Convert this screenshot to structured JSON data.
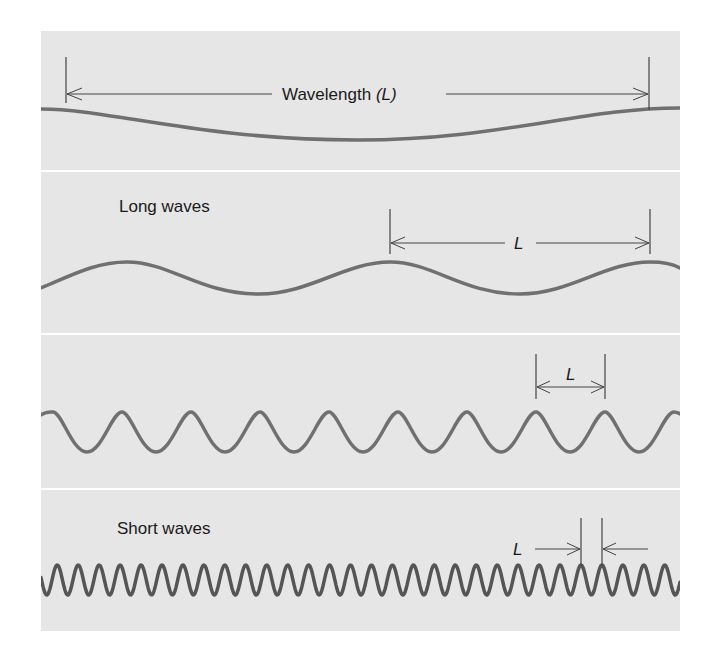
{
  "figure": {
    "background": "#ffffff",
    "panel_color": "#e6e6e6",
    "separator_color": "#ffffff",
    "wave_color": "#707070",
    "short_wave_color": "#555555",
    "annotation_color": "#444444",
    "text_color": "#1a1a1a"
  },
  "panels": [
    {
      "id": "wavelength-definition",
      "label": "",
      "dimension_text": "Wavelength",
      "dimension_symbol": "(L)"
    },
    {
      "id": "long-waves",
      "label": "Long waves",
      "dimension_symbol": "L"
    },
    {
      "id": "medium-waves",
      "label": "",
      "dimension_symbol": "L"
    },
    {
      "id": "short-waves",
      "label": "Short waves",
      "dimension_symbol": "L"
    }
  ]
}
